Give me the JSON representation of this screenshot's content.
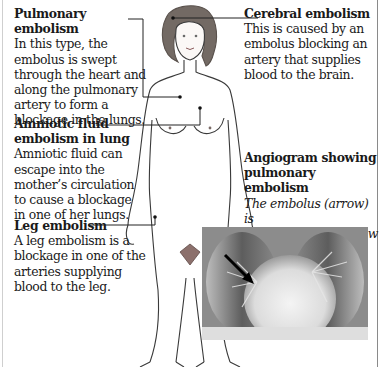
{
  "annotations": {
    "pulmonary": {
      "title": "Pulmonary embolism",
      "lines": [
        "In this type, the",
        "embolus is swept",
        "through the heart and",
        "along the pulmonary",
        "artery to form a",
        "blockage in the lungs."
      ]
    },
    "cerebral": {
      "title": "Cerebral embolism",
      "lines": [
        "This is caused by an",
        "embolus blocking an",
        "artery that supplies",
        "blood to the brain."
      ]
    },
    "amniotic": {
      "title_lines": [
        "Amniotic fluid",
        "embolism in lung"
      ],
      "lines": [
        "Amniotic fluid can",
        "escape into the",
        "mother’s circulation",
        "to cause a blockage",
        "in one of her lungs."
      ]
    },
    "leg": {
      "title": "Leg embolism",
      "lines": [
        "A leg embolism is a",
        "blockage in one of the",
        "arteries supplying",
        "blood to the leg."
      ]
    },
    "angiogram": {
      "title_lines": [
        "Angiogram showing",
        "pulmonary embolism"
      ],
      "lines": [
        "The embolus (arrow) is",
        "obstructing blood flow",
        "into the right lung."
      ]
    }
  },
  "figure": {
    "colors": {
      "hair": "#6e6660",
      "pubic": "#8a6e6a",
      "outline": "#3a3a3a",
      "leader": "#222222"
    }
  },
  "image": {
    "label": "chest angiogram x-ray",
    "arrow": "black arrow pointing to embolus"
  }
}
